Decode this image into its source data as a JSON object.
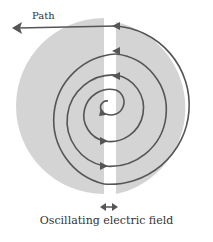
{
  "diagram": {
    "labels": {
      "path": "Path",
      "field": "Oscillating electric field"
    },
    "colors": {
      "dee_fill": "#d4d4d4",
      "path_stroke": "#555555",
      "background": "#ffffff"
    },
    "components": [
      "left dee",
      "right dee",
      "gap",
      "spiral particle path",
      "exit path arrow",
      "double-headed field arrow"
    ]
  }
}
